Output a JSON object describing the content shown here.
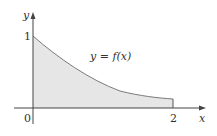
{
  "diagram": {
    "type": "area-under-curve",
    "axes": {
      "x_label": "x",
      "y_label": "y",
      "origin_label": "0",
      "x_tick_label": "2",
      "y_tick_label": "1"
    },
    "curve_label": "y = f(x)",
    "curve": {
      "description": "decreasing curve from (0,1) to (2,~0.13), region beneath shaded",
      "points": [
        [
          0,
          1
        ],
        [
          0.25,
          0.78
        ],
        [
          0.5,
          0.61
        ],
        [
          0.75,
          0.47
        ],
        [
          1,
          0.37
        ],
        [
          1.25,
          0.29
        ],
        [
          1.5,
          0.22
        ],
        [
          1.75,
          0.17
        ],
        [
          2,
          0.13
        ]
      ]
    },
    "colors": {
      "shade": "#e6e6e6",
      "curve": "#7a7a7a",
      "axis": "#444444",
      "text": "#333333"
    }
  }
}
